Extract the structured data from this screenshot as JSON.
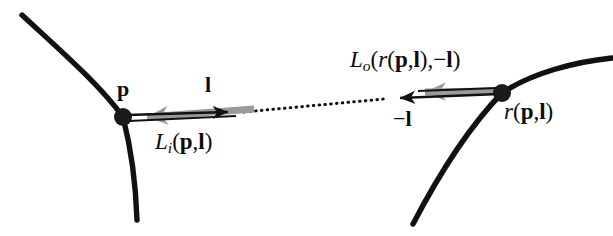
{
  "figure": {
    "background_color": "#ffffff",
    "curve_color": "#111111",
    "arrow_black_color": "#111111",
    "arrow_gray_color": "#9a9a9a",
    "dot_color": "#1a1a1a"
  },
  "labels": {
    "point_p": "p",
    "direction_l": "l",
    "incoming_radiance": {
      "symbol": "L",
      "subscript": "i",
      "open": "(",
      "arg1": "p",
      "comma": ",",
      "arg2": "l",
      "close": ")"
    },
    "outgoing_radiance": {
      "symbol": "L",
      "subscript": "o",
      "open": "(",
      "ray_fn": "r",
      "ray_open": "(",
      "ray_arg1": "p",
      "ray_comma": ",",
      "ray_arg2": "l",
      "ray_close": ")",
      "comma": ",",
      "arg2_sign": "−",
      "arg2": "l",
      "close": ")"
    },
    "negative_direction": {
      "sign": "−",
      "symbol": "l"
    },
    "ray_point": {
      "fn": "r",
      "open": "(",
      "arg1": "p",
      "comma": ",",
      "arg2": "l",
      "close": ")"
    }
  },
  "geometry": {
    "left_surface_curve": "M 22 15 C 62 52, 100 85, 123 117 C 132 152, 136 190, 137 220",
    "right_surface_curve": "M 413 224 C 437 178, 466 130, 502 93 C 532 73, 574 62, 612 58",
    "point_p": {
      "x": 123,
      "y": 117,
      "r": 9
    },
    "point_r": {
      "x": 502,
      "y": 93,
      "r": 9
    },
    "vector_l_arrow": {
      "x1": 127,
      "y1": 115,
      "x2": 243,
      "y2": 112
    },
    "vector_Li_arrow": {
      "x1": 252,
      "y1": 110,
      "x2": 129,
      "y2": 119
    },
    "dotted_ray": {
      "x1": 244,
      "y1": 112,
      "x2": 384,
      "y2": 99
    },
    "vector_minus_l_arrow": {
      "x1": 499,
      "y1": 94,
      "x2": 386,
      "y2": 99
    },
    "vector_Lo_arrow": {
      "x1": 496,
      "y1": 91,
      "x2": 406,
      "y2": 92
    }
  }
}
